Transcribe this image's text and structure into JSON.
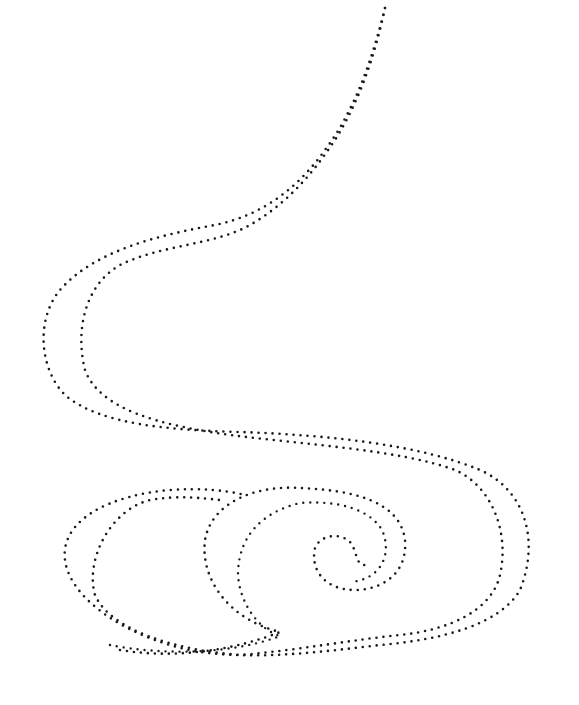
{
  "artwork": {
    "title": "",
    "background": "#ffffff",
    "dot_color": "#1a1a1a",
    "strokes": [
      {
        "name": "outer-swirl-stroke",
        "d": "M385 8 C372 60 355 110 325 150 C300 185 265 215 215 225 C160 235 95 250 60 290 C35 320 40 370 65 395 C100 425 170 430 240 432 C330 435 420 445 480 470 C525 490 540 540 520 590 C500 625 440 640 380 645 C320 652 260 660 200 652 C130 640 70 600 65 560 C60 520 110 495 170 490 C200 488 225 490 245 495",
        "width": 2.6,
        "dash": "0 7"
      },
      {
        "name": "inner-swirl-stroke",
        "d": "M385 8 C375 55 360 100 335 140 C312 175 285 205 250 225 C215 245 160 245 120 265 C85 285 75 330 85 370 C100 410 160 425 230 435 C310 445 400 450 455 470 C490 485 510 530 500 575 C492 610 450 630 400 635 C350 640 300 650 240 655 C175 650 110 630 95 595 C85 560 110 510 150 500 C180 495 200 498 220 500",
        "width": 2.6,
        "dash": "0 7"
      },
      {
        "name": "spiral-outer-stroke",
        "d": "M120 650 C180 660 240 648 280 632 C230 620 200 580 205 540 C212 500 260 485 300 488 C350 490 400 500 405 540 C408 575 380 590 355 590 C325 590 310 570 315 548 C320 535 340 532 350 542 C358 552 355 565 365 565",
        "width": 2.6,
        "dash": "0 7"
      },
      {
        "name": "spiral-inner-stroke",
        "d": "M110 645 C160 655 230 655 280 636 C260 630 240 605 238 575 C238 530 270 510 300 503 C340 500 370 510 382 530 C393 555 380 580 350 582",
        "width": 2.4,
        "dash": "0 7"
      }
    ]
  }
}
